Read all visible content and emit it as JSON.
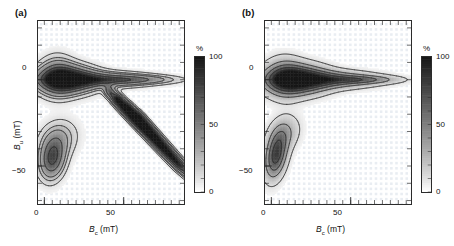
{
  "figure": {
    "type": "forc-diagram-pair",
    "panels": [
      {
        "label": "(a)",
        "name": "panel-a",
        "description": "FORC distribution with diagonal ridge artifacts"
      },
      {
        "label": "(b)",
        "name": "panel-b",
        "description": "Smoothed FORC distribution without artifacts"
      }
    ]
  },
  "axes": {
    "x": {
      "label_symbol": "B",
      "label_sub": "c",
      "label_unit": "(mT)",
      "ticks": [
        "0",
        "50"
      ],
      "tick_values": [
        0,
        50
      ],
      "min": -4,
      "max": 88,
      "minor_tick_step": 5
    },
    "y": {
      "label_symbol": "B",
      "label_sub": "u",
      "label_unit": "(mT)",
      "ticks": [
        "0",
        "−50"
      ],
      "tick_values": [
        0,
        -50
      ],
      "min": -72,
      "max": 34,
      "minor_tick_step": 10
    }
  },
  "colorbar": {
    "unit_label": "%",
    "ticks": [
      "100",
      "50",
      "0"
    ],
    "tick_values": [
      100,
      50,
      0
    ],
    "min": 0,
    "max": 100,
    "orientation": "vertical",
    "dark_end": "top",
    "color_low": "#ffffff",
    "color_high": "#1a1a1a"
  },
  "chart_data": {
    "type": "heatmap",
    "title": "",
    "xlabel": "Bc (mT)",
    "ylabel": "Bu (mT)",
    "zlabel": "%",
    "xlim": [
      -4,
      88
    ],
    "ylim": [
      -72,
      34
    ],
    "zlim": [
      0,
      100
    ],
    "grid": false,
    "legend_position": "right-colorbar",
    "panels": [
      {
        "name": "(a)",
        "features": [
          {
            "feature": "central-ridge",
            "peak_bc": 14,
            "peak_bu": 0,
            "peak_value": 100,
            "extent_bc": [
              0,
              78
            ],
            "extent_bu": [
              -22,
              18
            ],
            "contours": [
              10,
              30,
              50,
              70,
              90
            ]
          },
          {
            "feature": "lower-lobe",
            "peak_bc": 5,
            "peak_bu": -46,
            "peak_value": 72,
            "extent_bc": [
              0,
              22
            ],
            "extent_bu": [
              -58,
              -20
            ],
            "contours": [
              10,
              30,
              50
            ]
          },
          {
            "feature": "diagonal-artifact-ridges",
            "count": 4,
            "origin_bc": 40,
            "origin_bu": -8,
            "direction": "down-right",
            "slope": -1,
            "amplitude": 35,
            "contours": [
              10,
              20,
              30
            ]
          }
        ]
      },
      {
        "name": "(b)",
        "features": [
          {
            "feature": "central-ridge",
            "peak_bc": 16,
            "peak_bu": 0,
            "peak_value": 100,
            "extent_bc": [
              0,
              72
            ],
            "extent_bu": [
              -20,
              16
            ],
            "contours": [
              10,
              30,
              50,
              70,
              90
            ]
          },
          {
            "feature": "lower-lobe",
            "peak_bc": 3,
            "peak_bu": -44,
            "peak_value": 78,
            "extent_bc": [
              0,
              18
            ],
            "extent_bu": [
              -60,
              -18
            ],
            "contours": [
              10,
              30,
              50
            ]
          }
        ]
      }
    ]
  }
}
